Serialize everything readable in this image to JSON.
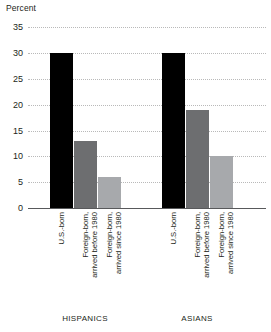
{
  "chart_data": {
    "type": "bar",
    "title": "",
    "subtitle": "",
    "xlabel": "",
    "ylabel": "Percent",
    "ylim": [
      0,
      35
    ],
    "ytick_step": 5,
    "yticks": [
      "0",
      "5",
      "10",
      "15",
      "20",
      "25",
      "30",
      "35"
    ],
    "grid": true,
    "legend": "none",
    "categories": [
      "U.S.-born",
      "Foreign-born,\narrived before 1980",
      "Foreign-born,\narrived since 1980"
    ],
    "groups": [
      "HISPANICS",
      "ASIANS"
    ],
    "series": [
      {
        "name": "HISPANICS",
        "values": [
          30,
          13,
          6
        ],
        "bars": [
          {
            "category": "U.S.-born",
            "value": 30,
            "color": "#000000"
          },
          {
            "category": "Foreign-born,\narrived before 1980",
            "value": 13,
            "color": "#6d6e70"
          },
          {
            "category": "Foreign-born,\narrived since 1980",
            "value": 6,
            "color": "#a7a9ac"
          }
        ]
      },
      {
        "name": "ASIANS",
        "values": [
          30,
          19,
          10
        ],
        "bars": [
          {
            "category": "U.S.-born",
            "value": 30,
            "color": "#000000"
          },
          {
            "category": "Foreign-born,\narrived before 1980",
            "value": 19,
            "color": "#6d6e70"
          },
          {
            "category": "Foreign-born,\narrived since 1980",
            "value": 10,
            "color": "#a7a9ac"
          }
        ]
      }
    ],
    "colors": {
      "us_born": "#000000",
      "foreign_before_1980": "#6d6e70",
      "foreign_since_1980": "#a7a9ac",
      "gridline": "#b9b9b9",
      "axis": "#58595b",
      "text": "#231f20",
      "background": "#ffffff"
    }
  }
}
